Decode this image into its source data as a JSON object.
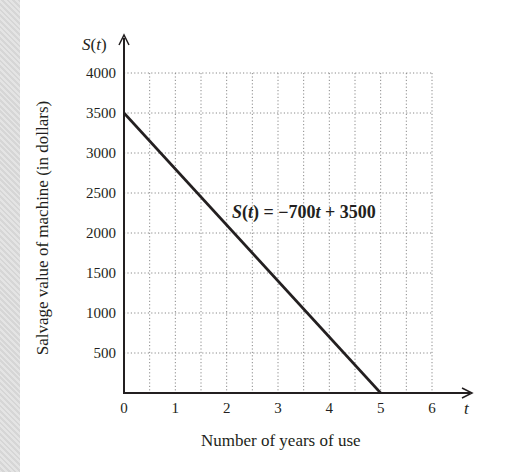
{
  "chart_data": {
    "type": "line",
    "title": "",
    "xlabel": "Number of years of use",
    "ylabel": "Salvage value of machine (in dollars)",
    "x_axis_symbol": "t",
    "y_axis_symbol": "S(t)",
    "xlim": [
      0,
      6
    ],
    "ylim": [
      0,
      4000
    ],
    "x_ticks": [
      "0",
      "1",
      "2",
      "3",
      "4",
      "5",
      "6"
    ],
    "y_ticks": [
      "500",
      "1000",
      "1500",
      "2000",
      "2500",
      "3000",
      "3500",
      "4000"
    ],
    "grid": true,
    "grid_x_step": 0.5,
    "grid_y_step": 500,
    "series": [
      {
        "name": "S(t) = −700t + 3500",
        "x": [
          0,
          5
        ],
        "y": [
          3500,
          0
        ]
      }
    ],
    "annotations": [
      {
        "text": "S(t) = −700t + 3500",
        "x": 2.6,
        "y": 2100
      }
    ],
    "legend": "none"
  },
  "labels": {
    "y_symbol_S": "S",
    "y_symbol_paren_open": "(",
    "y_symbol_t": "t",
    "y_symbol_paren_close": ")",
    "x_symbol": "t",
    "xlabel": "Number of years of use",
    "ylabel": "Salvage value of machine (in dollars)",
    "eq_S": "S",
    "eq_open": "(",
    "eq_t": "t",
    "eq_close": ")",
    "eq_rhs1": " = −700",
    "eq_t2": "t",
    "eq_rhs2": " + 3500"
  },
  "colors": {
    "line": "#231f20",
    "grid": "#8a8a8a",
    "background": "#ffffff",
    "edge_strip": "#dcdcdc"
  }
}
